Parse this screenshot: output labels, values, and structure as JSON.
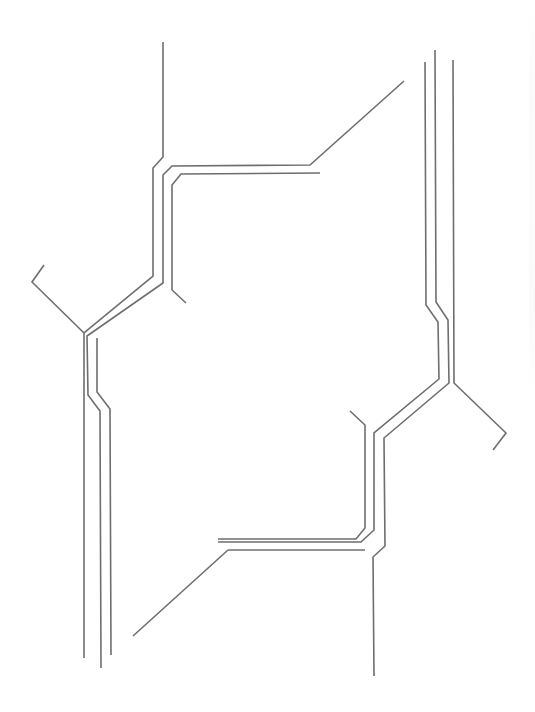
{
  "diagram": {
    "type": "circuit-trace-line-art",
    "background": "#ffffff",
    "stroke_color": "#6e6e6e",
    "stroke_width": 1.6,
    "groups": [
      {
        "name": "upper-left-trace-group",
        "traces": [
          {
            "name": "trace-top-entry",
            "points": [
              [
                163,
                42
              ],
              [
                163,
                157
              ],
              [
                153,
                168
              ],
              [
                153,
                276
              ],
              [
                84,
                333
              ],
              [
                84,
                658
              ]
            ]
          },
          {
            "name": "trace-left-branch",
            "points": [
              [
                44,
                265
              ],
              [
                32,
                282
              ],
              [
                84,
                333
              ]
            ]
          },
          {
            "name": "trace-middle",
            "points": [
              [
                404,
                81
              ],
              [
                310,
                165
              ],
              [
                172,
                166
              ],
              [
                163,
                175
              ],
              [
                163,
                283
              ],
              [
                87,
                336
              ],
              [
                88,
                395
              ],
              [
                100,
                411
              ],
              [
                101,
                668
              ]
            ]
          },
          {
            "name": "trace-inner",
            "points": [
              [
                320,
                173
              ],
              [
                181,
                174
              ],
              [
                172,
                185
              ],
              [
                172,
                290
              ],
              [
                186,
                303
              ]
            ]
          },
          {
            "name": "trace-inner-lower",
            "points": [
              [
                97,
                338
              ],
              [
                97,
                392
              ],
              [
                110,
                409
              ],
              [
                111,
                655
              ]
            ]
          }
        ]
      },
      {
        "name": "lower-right-trace-group",
        "traces": [
          {
            "name": "trace-right-outer-a",
            "points": [
              [
                425,
                62
              ],
              [
                426,
                305
              ],
              [
                438,
                322
              ],
              [
                439,
                379
              ],
              [
                374,
                433
              ],
              [
                374,
                530
              ],
              [
                361,
                542
              ],
              [
                218,
                542
              ]
            ]
          },
          {
            "name": "trace-right-outer-b",
            "points": [
              [
                435,
                50
              ],
              [
                436,
                302
              ],
              [
                448,
                320
              ],
              [
                449,
                383
              ],
              [
                384,
                438
              ],
              [
                385,
                546
              ],
              [
                373,
                557
              ],
              [
                374,
                676
              ]
            ]
          },
          {
            "name": "trace-right-bottom-branch",
            "points": [
              [
                228,
                550
              ],
              [
                133,
                636
              ]
            ]
          },
          {
            "name": "trace-right-bottom-link",
            "points": [
              [
                228,
                550
              ],
              [
                365,
                550
              ]
            ]
          },
          {
            "name": "trace-right-far",
            "points": [
              [
                453,
                60
              ],
              [
                454,
                383
              ],
              [
                506,
                433
              ],
              [
                493,
                450
              ]
            ]
          },
          {
            "name": "trace-right-inner-stub",
            "points": [
              [
                350,
                411
              ],
              [
                365,
                425
              ],
              [
                365,
                528
              ],
              [
                356,
                539
              ],
              [
                218,
                539
              ]
            ]
          }
        ]
      }
    ]
  }
}
